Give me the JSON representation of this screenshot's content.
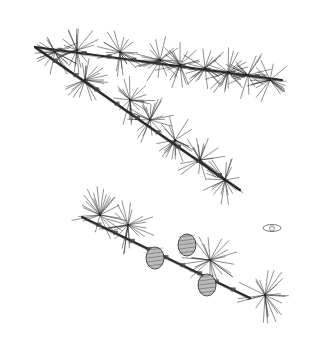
{
  "image": {
    "subject": "Botanical line illustration of larch branches",
    "background": "#ffffff",
    "ink": "#2a2a2a",
    "branches": [
      {
        "name": "upper-branch-left",
        "from": [
          35,
          47
        ],
        "to": [
          282,
          80
        ]
      },
      {
        "name": "upper-branch-diagonal",
        "from": [
          35,
          47
        ],
        "to": [
          240,
          190
        ]
      },
      {
        "name": "lower-branch",
        "from": [
          82,
          217
        ],
        "to": [
          250,
          298
        ]
      }
    ],
    "needle_clusters_upper": [
      [
        55,
        52
      ],
      [
        77,
        50
      ],
      [
        120,
        52
      ],
      [
        160,
        60
      ],
      [
        180,
        65
      ],
      [
        205,
        68
      ],
      [
        228,
        72
      ],
      [
        248,
        75
      ],
      [
        270,
        80
      ],
      [
        85,
        80
      ],
      [
        130,
        100
      ],
      [
        150,
        120
      ],
      [
        175,
        140
      ],
      [
        200,
        160
      ],
      [
        225,
        180
      ]
    ],
    "needle_clusters_lower": [
      [
        100,
        215
      ],
      [
        128,
        225
      ],
      [
        210,
        260
      ],
      [
        265,
        295
      ]
    ],
    "cones": [
      [
        155,
        258
      ],
      [
        187,
        245
      ],
      [
        207,
        285
      ]
    ],
    "seed_detail": [
      272,
      228
    ]
  }
}
